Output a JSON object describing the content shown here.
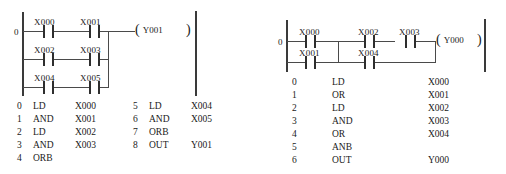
{
  "page": {
    "background_color": "#ffffff",
    "line_color": "#3a3a3a",
    "text_color": "#1a1a1a"
  },
  "diagrams": [
    {
      "id": "left",
      "name": "ORB example - three parallel AND branches",
      "rung_number": "0",
      "coil": {
        "open_paren": "(",
        "name": "Y001",
        "close_paren": ")"
      },
      "branches": [
        {
          "contacts": [
            {
              "label": "X000"
            },
            {
              "label": "X001"
            }
          ]
        },
        {
          "contacts": [
            {
              "label": "X002"
            },
            {
              "label": "X003"
            }
          ]
        },
        {
          "contacts": [
            {
              "label": "X004"
            },
            {
              "label": "X005"
            }
          ]
        }
      ],
      "instruction_list": {
        "columns": [
          "step",
          "instruction",
          "operand"
        ],
        "left_column": [
          {
            "step": "0",
            "instruction": "LD",
            "operand": "X000"
          },
          {
            "step": "1",
            "instruction": "AND",
            "operand": "X001"
          },
          {
            "step": "2",
            "instruction": "LD",
            "operand": "X002"
          },
          {
            "step": "3",
            "instruction": "AND",
            "operand": "X003"
          },
          {
            "step": "4",
            "instruction": "ORB",
            "operand": ""
          }
        ],
        "right_column": [
          {
            "step": "5",
            "instruction": "LD",
            "operand": "X004"
          },
          {
            "step": "6",
            "instruction": "AND",
            "operand": "X005"
          },
          {
            "step": "7",
            "instruction": "ORB",
            "operand": ""
          },
          {
            "step": "8",
            "instruction": "OUT",
            "operand": "Y001"
          }
        ]
      }
    },
    {
      "id": "right",
      "name": "ANB example - two parallel OR blocks in series",
      "rung_number": "0",
      "coil": {
        "open_paren": "(",
        "name": "Y000",
        "close_paren": ")"
      },
      "block_a": {
        "top": {
          "label": "X000"
        },
        "bottom": {
          "label": "X001"
        }
      },
      "block_b": {
        "top": {
          "label": "X002"
        },
        "bottom": {
          "label": "X004"
        }
      },
      "series_contact": {
        "label": "X003"
      },
      "instruction_list": {
        "columns": [
          "step",
          "instruction",
          "operand"
        ],
        "rows": [
          {
            "step": "0",
            "instruction": "LD",
            "operand": "X000"
          },
          {
            "step": "1",
            "instruction": "OR",
            "operand": "X001"
          },
          {
            "step": "2",
            "instruction": "LD",
            "operand": "X002"
          },
          {
            "step": "3",
            "instruction": "AND",
            "operand": "X003"
          },
          {
            "step": "4",
            "instruction": "OR",
            "operand": "X004"
          },
          {
            "step": "5",
            "instruction": "ANB",
            "operand": ""
          },
          {
            "step": "6",
            "instruction": "OUT",
            "operand": "Y000"
          }
        ]
      }
    }
  ]
}
